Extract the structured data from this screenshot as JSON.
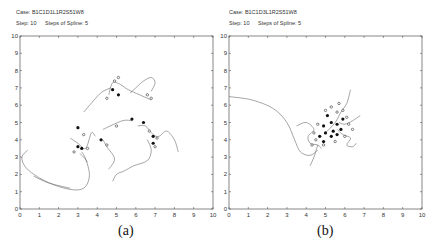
{
  "chart_data": [
    {
      "type": "line",
      "panel_label": "(a)",
      "title_lines": [
        "Case: B1C1D1L1R2S51W8",
        "Step: 10",
        "Steps of Spline: 5"
      ],
      "xlim": [
        0,
        10
      ],
      "ylim": [
        0,
        10
      ],
      "xticks": [
        0,
        1,
        2,
        3,
        4,
        5,
        6,
        7,
        8,
        9,
        10
      ],
      "yticks": [
        0,
        1,
        2,
        3,
        4,
        5,
        6,
        7,
        8,
        9,
        10
      ],
      "grid": false,
      "curves": [
        [
          [
            0.4,
            3.4
          ],
          [
            0.1,
            3.0
          ],
          [
            0.3,
            2.4
          ],
          [
            1.0,
            1.8
          ],
          [
            2.0,
            1.3
          ],
          [
            2.9,
            1.1
          ],
          [
            3.4,
            1.3
          ],
          [
            3.6,
            2.0
          ],
          [
            3.4,
            2.9
          ],
          [
            3.2,
            3.3
          ]
        ],
        [
          [
            0.7,
            1.9
          ],
          [
            1.5,
            1.5
          ],
          [
            2.6,
            1.2
          ]
        ],
        [
          [
            2.6,
            4.1
          ],
          [
            3.0,
            3.8
          ],
          [
            3.4,
            3.5
          ],
          [
            3.7,
            4.4
          ],
          [
            3.9,
            4.2
          ]
        ],
        [
          [
            3.1,
            3.2
          ],
          [
            3.3,
            3.0
          ],
          [
            3.5,
            2.7
          ]
        ],
        [
          [
            3.3,
            5.6
          ],
          [
            4.0,
            6.5
          ],
          [
            4.3,
            6.8
          ],
          [
            4.7,
            7.0
          ]
        ],
        [
          [
            4.6,
            6.6
          ],
          [
            4.8,
            7.3
          ],
          [
            5.2,
            7.2
          ],
          [
            5.6,
            6.9
          ],
          [
            6.2,
            6.6
          ],
          [
            6.8,
            6.3
          ]
        ],
        [
          [
            5.7,
            6.7
          ],
          [
            6.0,
            7.0
          ],
          [
            6.4,
            7.4
          ],
          [
            6.8,
            7.6
          ],
          [
            7.0,
            7.3
          ],
          [
            6.8,
            6.8
          ]
        ],
        [
          [
            4.3,
            4.6
          ],
          [
            5.3,
            5.1
          ],
          [
            5.8,
            5.1
          ]
        ],
        [
          [
            6.1,
            4.8
          ],
          [
            6.5,
            4.8
          ],
          [
            6.9,
            4.3
          ],
          [
            7.2,
            4.2
          ],
          [
            7.6,
            4.5
          ],
          [
            8.0,
            4.0
          ],
          [
            8.2,
            3.3
          ]
        ],
        [
          [
            6.6,
            4.0
          ],
          [
            6.8,
            3.4
          ],
          [
            6.6,
            2.8
          ],
          [
            5.9,
            2.5
          ],
          [
            5.4,
            2.2
          ],
          [
            5.0,
            2.0
          ],
          [
            4.8,
            1.6
          ]
        ],
        [
          [
            4.3,
            4.0
          ],
          [
            4.5,
            3.6
          ],
          [
            4.9,
            2.9
          ],
          [
            4.6,
            2.3
          ]
        ]
      ],
      "points_filled": [
        [
          3.0,
          4.7
        ],
        [
          3.0,
          3.6
        ],
        [
          3.2,
          3.5
        ],
        [
          4.8,
          6.9
        ],
        [
          5.1,
          6.6
        ],
        [
          5.8,
          5.2
        ],
        [
          6.4,
          5.0
        ],
        [
          6.9,
          4.2
        ],
        [
          6.9,
          3.8
        ],
        [
          4.2,
          4.0
        ]
      ],
      "points_open": [
        [
          3.3,
          4.3
        ],
        [
          3.5,
          3.5
        ],
        [
          2.8,
          3.3
        ],
        [
          4.5,
          6.4
        ],
        [
          4.9,
          7.4
        ],
        [
          5.1,
          7.6
        ],
        [
          6.6,
          6.6
        ],
        [
          6.8,
          6.4
        ],
        [
          5.0,
          4.8
        ],
        [
          6.7,
          4.5
        ],
        [
          7.1,
          4.1
        ],
        [
          7.0,
          3.6
        ],
        [
          4.5,
          3.7
        ]
      ]
    },
    {
      "type": "line",
      "panel_label": "(b)",
      "title_lines": [
        "Case: B1C1D3L1R2S51W8",
        "Step: 10",
        "Steps of Spline: 5"
      ],
      "xlim": [
        0,
        10
      ],
      "ylim": [
        0,
        10
      ],
      "xticks": [
        0,
        1,
        2,
        3,
        4,
        5,
        6,
        7,
        8,
        9,
        10
      ],
      "yticks": [
        0,
        1,
        2,
        3,
        4,
        5,
        6,
        7,
        8,
        9,
        10
      ],
      "grid": false,
      "curves": [
        [
          [
            0.0,
            6.5
          ],
          [
            1.2,
            6.3
          ],
          [
            2.3,
            5.8
          ],
          [
            3.0,
            5.0
          ],
          [
            3.4,
            4.0
          ],
          [
            3.7,
            3.3
          ],
          [
            4.2,
            3.1
          ],
          [
            4.6,
            3.4
          ]
        ],
        [
          [
            3.5,
            4.8
          ],
          [
            4.0,
            5.0
          ],
          [
            4.4,
            4.6
          ],
          [
            4.1,
            4.2
          ],
          [
            4.2,
            3.8
          ],
          [
            4.6,
            3.7
          ],
          [
            4.8,
            3.5
          ]
        ],
        [
          [
            4.6,
            3.7
          ],
          [
            4.4,
            3.0
          ],
          [
            4.2,
            2.5
          ]
        ],
        [
          [
            5.0,
            4.4
          ],
          [
            5.5,
            5.0
          ],
          [
            5.8,
            5.6
          ],
          [
            6.1,
            6.1
          ],
          [
            6.3,
            6.9
          ]
        ],
        [
          [
            5.6,
            4.6
          ],
          [
            5.9,
            4.3
          ],
          [
            6.3,
            4.1
          ],
          [
            6.1,
            3.7
          ],
          [
            6.4,
            3.6
          ],
          [
            6.6,
            3.8
          ]
        ],
        [
          [
            5.7,
            5.0
          ],
          [
            6.0,
            4.9
          ],
          [
            6.4,
            5.1
          ],
          [
            6.8,
            5.4
          ]
        ]
      ],
      "points_filled": [
        [
          4.9,
          4.8
        ],
        [
          5.1,
          5.4
        ],
        [
          5.3,
          5.0
        ],
        [
          5.0,
          4.4
        ],
        [
          5.4,
          4.5
        ],
        [
          5.6,
          4.9
        ],
        [
          5.3,
          4.2
        ],
        [
          4.7,
          4.2
        ],
        [
          5.8,
          4.6
        ],
        [
          5.9,
          5.2
        ],
        [
          5.6,
          4.3
        ],
        [
          4.9,
          3.9
        ]
      ],
      "points_open": [
        [
          4.5,
          4.0
        ],
        [
          4.3,
          3.7
        ],
        [
          4.6,
          4.9
        ],
        [
          5.0,
          5.7
        ],
        [
          5.3,
          5.9
        ],
        [
          5.6,
          5.6
        ],
        [
          5.9,
          5.7
        ],
        [
          6.1,
          5.3
        ],
        [
          6.2,
          4.9
        ],
        [
          6.0,
          4.2
        ],
        [
          5.5,
          3.9
        ],
        [
          4.9,
          3.7
        ],
        [
          4.4,
          4.4
        ],
        [
          6.4,
          4.6
        ],
        [
          5.7,
          6.1
        ]
      ]
    }
  ],
  "panels": [
    {
      "case": "Case: B1C1D1L1R2S51W8",
      "step": "Step: 10",
      "spline": "Steps of Spline: 5",
      "caption": "(a)"
    },
    {
      "case": "Case: B1C1D3L1R2S51W8",
      "step": "Step: 10",
      "spline": "Steps of Spline: 5",
      "caption": "(b)"
    }
  ],
  "colors": {
    "axis": "#555555",
    "curve": "#6a6a6a",
    "point": "#111111",
    "text": "#333333"
  }
}
